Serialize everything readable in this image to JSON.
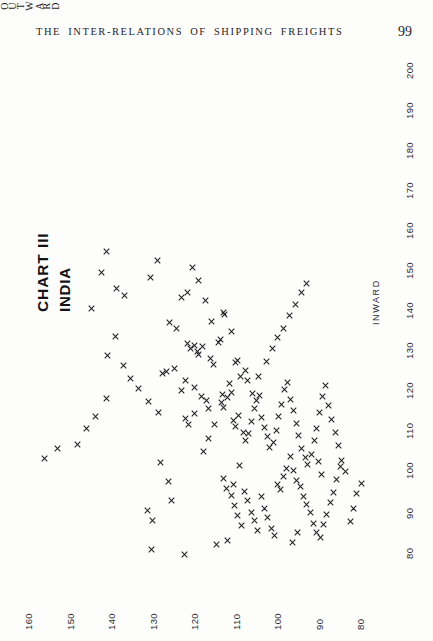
{
  "header": {
    "title": "THE INTER-RELATIONS OF SHIPPING FREIGHTS",
    "page_number": "99"
  },
  "chart_title": {
    "main": "CHART III",
    "subtitle": "INDIA"
  },
  "chart_data": {
    "type": "scatter",
    "title": "CHART III",
    "subtitle": "INDIA",
    "orientation": "rotated-90",
    "xlabel": "INWARD",
    "ylabel": "OUTWARD",
    "xlim": [
      75,
      205
    ],
    "ylim": [
      75,
      165
    ],
    "grid": false,
    "legend": null,
    "marker": "x",
    "marker_color": "#202024",
    "x_ticks": [
      80,
      90,
      100,
      110,
      120,
      130,
      140,
      150,
      160,
      170,
      180,
      190,
      200
    ],
    "x_tick_labels": [
      "80",
      "90",
      "100",
      "110",
      "120",
      "130",
      "140",
      "150",
      "160",
      "170",
      "180",
      "190",
      "200"
    ],
    "y_ticks": [
      80,
      90,
      100,
      110,
      120,
      130,
      140,
      150,
      160
    ],
    "y_tick_labels": [
      "80",
      "90",
      "100",
      "110",
      "120",
      "130",
      "140",
      "150",
      "160"
    ],
    "points": [
      [
        150.2,
        120.4
      ],
      [
        146.8,
        119.0
      ],
      [
        142.0,
        117.2
      ],
      [
        136.6,
        115.8
      ],
      [
        139.0,
        113.0
      ],
      [
        138.5,
        112.6
      ],
      [
        134.1,
        111.0
      ],
      [
        131.2,
        121.6
      ],
      [
        130.0,
        120.8
      ],
      [
        130.6,
        119.9
      ],
      [
        129.2,
        119.2
      ],
      [
        128.4,
        118.8
      ],
      [
        130.3,
        118.0
      ],
      [
        127.5,
        116.1
      ],
      [
        126.0,
        115.4
      ],
      [
        131.4,
        114.0
      ],
      [
        132.2,
        113.6
      ],
      [
        123.6,
        127.5
      ],
      [
        124.1,
        126.6
      ],
      [
        125.0,
        124.7
      ],
      [
        119.4,
        123.0
      ],
      [
        122.0,
        122.0
      ],
      [
        126.4,
        110.0
      ],
      [
        127.0,
        109.6
      ],
      [
        121.2,
        111.4
      ],
      [
        118.5,
        113.2
      ],
      [
        120.2,
        120.0
      ],
      [
        118.0,
        118.2
      ],
      [
        117.0,
        117.1
      ],
      [
        114.8,
        116.5
      ],
      [
        112.4,
        122.0
      ],
      [
        111.0,
        121.3
      ],
      [
        113.6,
        120.0
      ],
      [
        116.3,
        113.4
      ],
      [
        115.2,
        112.9
      ],
      [
        117.6,
        112.0
      ],
      [
        119.0,
        111.0
      ],
      [
        123.0,
        108.7
      ],
      [
        124.5,
        107.6
      ],
      [
        121.8,
        107.0
      ],
      [
        112.0,
        110.6
      ],
      [
        110.4,
        110.0
      ],
      [
        113.2,
        109.2
      ],
      [
        109.0,
        108.1
      ],
      [
        107.0,
        107.6
      ],
      [
        108.6,
        106.8
      ],
      [
        111.6,
        106.2
      ],
      [
        115.0,
        105.5
      ],
      [
        116.8,
        105.0
      ],
      [
        118.2,
        104.2
      ],
      [
        112.6,
        103.8
      ],
      [
        110.2,
        103.0
      ],
      [
        107.8,
        102.4
      ],
      [
        105.2,
        101.8
      ],
      [
        106.4,
        100.9
      ],
      [
        109.4,
        100.2
      ],
      [
        113.0,
        99.6
      ],
      [
        116.0,
        99.0
      ],
      [
        119.6,
        98.2
      ],
      [
        121.4,
        97.4
      ],
      [
        117.2,
        96.8
      ],
      [
        114.4,
        96.0
      ],
      [
        111.2,
        95.4
      ],
      [
        108.2,
        94.8
      ],
      [
        104.8,
        94.0
      ],
      [
        102.6,
        93.2
      ],
      [
        100.8,
        92.6
      ],
      [
        103.4,
        91.8
      ],
      [
        106.8,
        91.0
      ],
      [
        110.0,
        90.4
      ],
      [
        113.8,
        89.8
      ],
      [
        117.8,
        89.0
      ],
      [
        120.6,
        88.2
      ],
      [
        115.6,
        87.6
      ],
      [
        112.2,
        86.8
      ],
      [
        108.8,
        86.0
      ],
      [
        105.6,
        85.2
      ],
      [
        102.0,
        84.4
      ],
      [
        99.2,
        83.6
      ],
      [
        101.4,
        128.0
      ],
      [
        96.6,
        126.2
      ],
      [
        92.0,
        125.4
      ],
      [
        89.4,
        131.2
      ],
      [
        86.8,
        130.0
      ],
      [
        97.4,
        113.0
      ],
      [
        95.0,
        112.2
      ],
      [
        93.2,
        111.0
      ],
      [
        90.6,
        110.2
      ],
      [
        88.2,
        109.4
      ],
      [
        85.6,
        108.6
      ],
      [
        94.2,
        107.8
      ],
      [
        91.8,
        107.0
      ],
      [
        89.0,
        106.2
      ],
      [
        87.0,
        105.4
      ],
      [
        84.4,
        104.6
      ],
      [
        92.8,
        103.8
      ],
      [
        90.0,
        103.0
      ],
      [
        87.6,
        102.2
      ],
      [
        85.0,
        101.4
      ],
      [
        83.2,
        100.6
      ],
      [
        96.0,
        100.0
      ],
      [
        94.6,
        99.2
      ],
      [
        98.0,
        98.4
      ],
      [
        100.0,
        97.6
      ],
      [
        103.0,
        96.8
      ],
      [
        99.4,
        96.0
      ],
      [
        97.0,
        95.2
      ],
      [
        95.4,
        94.4
      ],
      [
        93.0,
        93.6
      ],
      [
        91.0,
        92.8
      ],
      [
        88.8,
        92.0
      ],
      [
        86.2,
        91.2
      ],
      [
        84.0,
        90.4
      ],
      [
        82.6,
        89.6
      ],
      [
        85.8,
        88.8
      ],
      [
        88.4,
        88.0
      ],
      [
        91.4,
        87.2
      ],
      [
        94.0,
        86.4
      ],
      [
        97.2,
        85.6
      ],
      [
        100.4,
        84.8
      ],
      [
        154.2,
        141.0
      ],
      [
        149.0,
        142.2
      ],
      [
        145.0,
        138.6
      ],
      [
        143.2,
        136.8
      ],
      [
        140.0,
        144.6
      ],
      [
        147.6,
        130.4
      ],
      [
        152.0,
        128.8
      ],
      [
        133.0,
        139.0
      ],
      [
        128.2,
        140.8
      ],
      [
        125.6,
        137.0
      ],
      [
        122.4,
        135.2
      ],
      [
        119.8,
        133.4
      ],
      [
        136.4,
        126.0
      ],
      [
        134.8,
        124.2
      ],
      [
        142.6,
        123.0
      ],
      [
        144.0,
        121.6
      ],
      [
        106.0,
        148.0
      ],
      [
        109.8,
        146.0
      ],
      [
        112.8,
        143.8
      ],
      [
        117.4,
        141.0
      ],
      [
        102.4,
        156.0
      ],
      [
        105.0,
        153.0
      ],
      [
        118.6,
        105.8
      ],
      [
        122.8,
        104.4
      ],
      [
        126.6,
        102.6
      ],
      [
        129.8,
        101.2
      ],
      [
        132.6,
        99.8
      ],
      [
        135.0,
        98.4
      ],
      [
        138.2,
        97.0
      ],
      [
        141.0,
        95.6
      ],
      [
        143.8,
        94.2
      ],
      [
        146.2,
        92.8
      ],
      [
        101.6,
        90.0
      ],
      [
        98.4,
        89.2
      ],
      [
        95.8,
        110.4
      ],
      [
        100.6,
        109.0
      ],
      [
        104.2,
        117.8
      ],
      [
        107.4,
        116.4
      ],
      [
        110.8,
        115.0
      ],
      [
        114.0,
        128.6
      ],
      [
        116.6,
        131.0
      ],
      [
        80.8,
        114.6
      ],
      [
        82.0,
        112.0
      ],
      [
        81.4,
        96.2
      ],
      [
        83.8,
        95.0
      ],
      [
        86.6,
        82.4
      ],
      [
        89.8,
        81.6
      ],
      [
        93.6,
        80.8
      ],
      [
        96.2,
        79.6
      ],
      [
        79.6,
        130.2
      ],
      [
        78.4,
        122.4
      ]
    ]
  },
  "axis_labels": {
    "inward": "INWARD",
    "outward": "OUTWARD"
  }
}
